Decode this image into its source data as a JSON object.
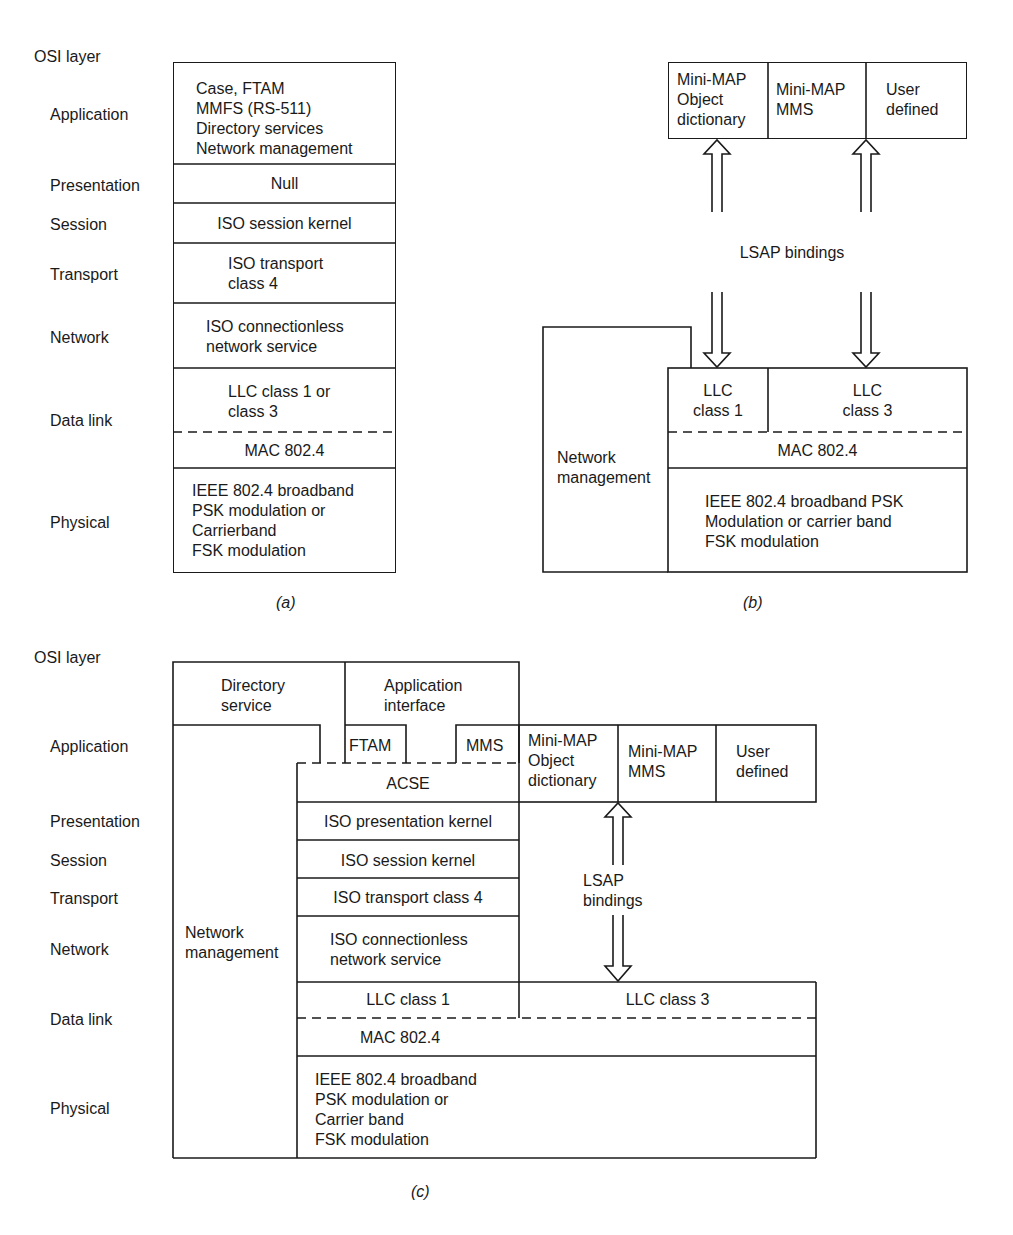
{
  "panel_a": {
    "caption": "(a)",
    "osi_header": "OSI layer",
    "layer_labels": [
      "Application",
      "Presentation",
      "Session",
      "Transport",
      "Network",
      "Data link",
      "Physical"
    ],
    "cells": {
      "application": "Case, FTAM\nMMFS (RS-511)\nDirectory services\nNetwork management",
      "presentation": "Null",
      "session": "ISO session kernel",
      "transport": "ISO transport\nclass 4",
      "network": "ISO connectionless\nnetwork service",
      "llc": "LLC class 1 or\nclass 3",
      "mac": "MAC 802.4",
      "physical": "IEEE 802.4 broadband\nPSK modulation or\nCarrierband\nFSK modulation"
    }
  },
  "panel_b": {
    "caption": "(b)",
    "top_row": [
      "Mini-MAP\nObject\ndictionary",
      "Mini-MAP\nMMS",
      "User\ndefined"
    ],
    "lsap_label": "LSAP bindings",
    "network_management": "Network\nmanagement",
    "llc1": "LLC\nclass 1",
    "llc3": "LLC\nclass 3",
    "mac": "MAC 802.4",
    "physical": "IEEE 802.4 broadband PSK\nModulation or carrier band\nFSK modulation"
  },
  "panel_c": {
    "caption": "(c)",
    "osi_header": "OSI layer",
    "layer_labels": [
      "Application",
      "Presentation",
      "Session",
      "Transport",
      "Network",
      "Data link",
      "Physical"
    ],
    "directory_service": "Directory\nservice",
    "application_interface": "Application\ninterface",
    "ftam": "FTAM",
    "mms": "MMS",
    "acse": "ACSE",
    "minimap_row": [
      "Mini-MAP\nObject\ndictionary",
      "Mini-MAP\nMMS",
      "User\ndefined"
    ],
    "presentation": "ISO presentation kernel",
    "session": "ISO session kernel",
    "transport": "ISO transport class 4",
    "network": "ISO connectionless\nnetwork service",
    "network_management": "Network\nmanagement",
    "lsap_label": "LSAP\nbindings",
    "llc1": "LLC class 1",
    "llc3": "LLC class 3",
    "mac": "MAC 802.4",
    "physical": "IEEE 802.4 broadband\nPSK modulation or\nCarrier band\nFSK modulation"
  },
  "colors": {
    "ink": "#1a1a1a",
    "paper": "#ffffff"
  }
}
